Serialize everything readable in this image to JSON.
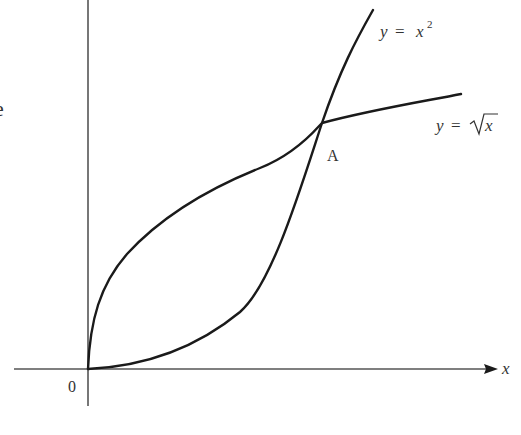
{
  "diagram": {
    "type": "graph-of-curves",
    "axes": {
      "origin_label": "0",
      "x_axis_label": "x"
    },
    "curves": [
      {
        "name": "parabola",
        "label_lhs": "y",
        "label_eq": "=",
        "label_rhs": "x",
        "label_exp": "2",
        "equation": "y = x^2"
      },
      {
        "name": "square-root",
        "label_lhs": "y",
        "label_eq": "=",
        "label_rhs": "x",
        "equation": "y = sqrt(x)"
      }
    ],
    "points": [
      {
        "name": "A",
        "label": "A",
        "description": "intersection of y = x^2 and y = sqrt(x)"
      }
    ],
    "edge_fragment": "e",
    "colors": {
      "curve": "#1a1a1a",
      "axis": "#555555",
      "text": "#333333",
      "background": "#ffffff"
    }
  }
}
